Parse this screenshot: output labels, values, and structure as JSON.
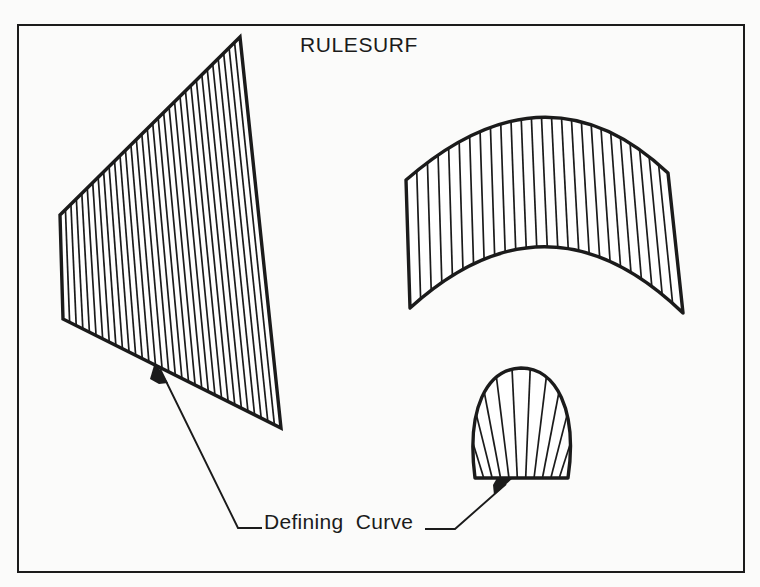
{
  "figure": {
    "title": "RULESURF",
    "background_color": "#fbfbfa",
    "ink_color": "#1b1b1b",
    "frame": {
      "name": "figure-border",
      "x": 17,
      "y": 24,
      "width": 727,
      "height": 548,
      "stroke_width": 2
    },
    "labels": {
      "defining_curve": "Defining  Curve"
    },
    "shapes": [
      {
        "name": "quadrilateral-ruled-surface",
        "type": "ruled-quadrilateral",
        "description": "Four sided planar ruled surface with vertical rule lines",
        "vertices": [
          [
            240,
            37
          ],
          [
            281,
            428
          ],
          [
            63,
            319
          ],
          [
            60,
            215
          ]
        ],
        "rule_line_count": 33
      },
      {
        "name": "arch-ruled-surface",
        "type": "ruled-arch",
        "description": "Vaulted surface between two concentric arcs with vertical rule lines",
        "top_arc": {
          "left": [
            406,
            180
          ],
          "apex": [
            546,
            87
          ],
          "right": [
            668,
            173
          ]
        },
        "bottom_arc": {
          "left": [
            410,
            308
          ],
          "low": [
            548,
            225
          ],
          "right": [
            683,
            313
          ]
        },
        "rule_line_count": 26
      },
      {
        "name": "fan-ruled-surface",
        "type": "ruled-fan",
        "description": "Shell shaped surface radiating from a straight base line to an arc",
        "base_line": {
          "left": [
            475,
            478
          ],
          "right": [
            568,
            478
          ]
        },
        "arc_apex": [
          521,
          368
        ],
        "rule_line_count": 11
      }
    ],
    "leaders": [
      {
        "name": "leader-left-defining-curve",
        "arrow_tip": [
          155,
          362
        ],
        "elbow": [
          238,
          528
        ],
        "tail": [
          262,
          528
        ],
        "points_to": "quadrilateral-ruled-surface"
      },
      {
        "name": "leader-right-defining-curve",
        "arrow_tip": [
          513,
          478
        ],
        "elbow": [
          455,
          529
        ],
        "tail": [
          425,
          529
        ],
        "points_to": "fan-ruled-surface"
      }
    ]
  }
}
